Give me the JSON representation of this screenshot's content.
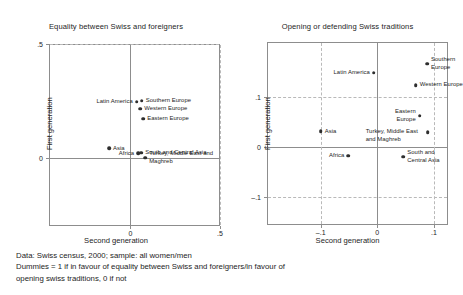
{
  "figure": {
    "caption_lines": [
      "Data: Swiss census, 2000; sample: all women/men",
      "Dummies = 1 if in favour of equality between Swiss and foreigners/in favour of",
      "opening swiss traditions, 0 if not"
    ],
    "marker_color": "#2e2e2e",
    "axis_color": "#8d8d8d",
    "grid_color": "#b9b9b9"
  },
  "chart_data": [
    {
      "type": "scatter",
      "title": "Equality between Swiss and foreigners",
      "xlabel": "Second generation",
      "ylabel": "First generation",
      "xlim": [
        -0.455,
        0.5
      ],
      "ylim": [
        -0.295,
        0.5
      ],
      "xticks": [
        0,
        0.5
      ],
      "xticklabels": [
        "0",
        ".5"
      ],
      "yticks": [
        0,
        0.5
      ],
      "yticklabels": [
        "0",
        ".5"
      ],
      "grid": true,
      "points": [
        {
          "label": "Latin America",
          "x": 0.035,
          "y": 0.248,
          "label_pos": "left"
        },
        {
          "label": "Southern Europe",
          "x": 0.063,
          "y": 0.252,
          "label_pos": "right"
        },
        {
          "label": "Western Europe",
          "x": 0.054,
          "y": 0.217,
          "label_pos": "right"
        },
        {
          "label": "Eastern Europe",
          "x": 0.071,
          "y": 0.173,
          "label_pos": "right"
        },
        {
          "label": "Asia",
          "x": -0.12,
          "y": 0.044,
          "label_pos": "right"
        },
        {
          "label": "Africa",
          "x": 0.043,
          "y": 0.022,
          "label_pos": "left"
        },
        {
          "label": "South and Central Asia",
          "x": 0.06,
          "y": 0.026,
          "label_pos": "right"
        },
        {
          "label": "Turkey, Middle East and\nMaghreb",
          "x": 0.082,
          "y": 0.004,
          "label_pos": "right"
        }
      ]
    },
    {
      "type": "scatter",
      "title": "Opening or defending Swiss traditions",
      "xlabel": "Second generation",
      "ylabel": "First generation",
      "xlim": [
        -0.195,
        0.125
      ],
      "ylim": [
        -0.155,
        0.21
      ],
      "xticks": [
        -0.1,
        0,
        0.1
      ],
      "xticklabels": [
        "–.1",
        "0",
        ".1"
      ],
      "yticks": [
        -0.1,
        0,
        0.1
      ],
      "yticklabels": [
        "–.1",
        "0",
        ".1"
      ],
      "grid": true,
      "points": [
        {
          "label": "Latin America",
          "x": -0.006,
          "y": 0.149,
          "label_pos": "left"
        },
        {
          "label": "Southern\nEurope",
          "x": 0.088,
          "y": 0.167,
          "label_pos": "right"
        },
        {
          "label": "Western Europe",
          "x": 0.068,
          "y": 0.124,
          "label_pos": "right"
        },
        {
          "label": "Eastern\nEurope",
          "x": 0.075,
          "y": 0.063,
          "label_pos": "left"
        },
        {
          "label": "Turkey, Middle East\nand Maghreb",
          "x": 0.089,
          "y": 0.03,
          "label_pos": "left-below"
        },
        {
          "label": "Asia",
          "x": -0.1,
          "y": 0.032,
          "label_pos": "right"
        },
        {
          "label": "Africa",
          "x": -0.051,
          "y": -0.017,
          "label_pos": "left"
        },
        {
          "label": "South and\nCentral Asia",
          "x": 0.046,
          "y": -0.019,
          "label_pos": "right"
        }
      ]
    }
  ]
}
